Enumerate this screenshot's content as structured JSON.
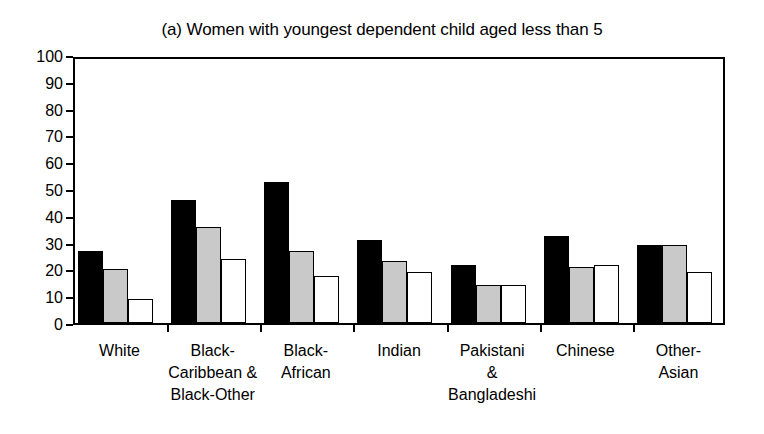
{
  "chart_data": {
    "type": "bar",
    "title": "(a) Women with youngest dependent child aged less than 5",
    "xlabel": "",
    "ylabel": "",
    "ylim": [
      0,
      100
    ],
    "yticks": [
      0,
      10,
      20,
      30,
      40,
      50,
      60,
      70,
      80,
      90,
      100
    ],
    "grid": false,
    "legend": "none",
    "categories": [
      "White",
      "Black-\nCaribbean &\nBlack-Other",
      "Black-\nAfrican",
      "Indian",
      "Pakistani\n&\nBangladeshi",
      "Chinese",
      "Other-\nAsian"
    ],
    "series": [
      {
        "name": "series-1-black",
        "color": "#000000",
        "values": [
          27,
          46,
          52.5,
          31,
          21.5,
          32.5,
          29
        ]
      },
      {
        "name": "series-2-grey",
        "color": "#c9c9c9",
        "values": [
          20,
          36,
          27,
          23,
          14,
          21,
          29
        ]
      },
      {
        "name": "series-3-white",
        "color": "#ffffff",
        "values": [
          9,
          24,
          17.5,
          19,
          14,
          21.5,
          19
        ]
      }
    ]
  }
}
